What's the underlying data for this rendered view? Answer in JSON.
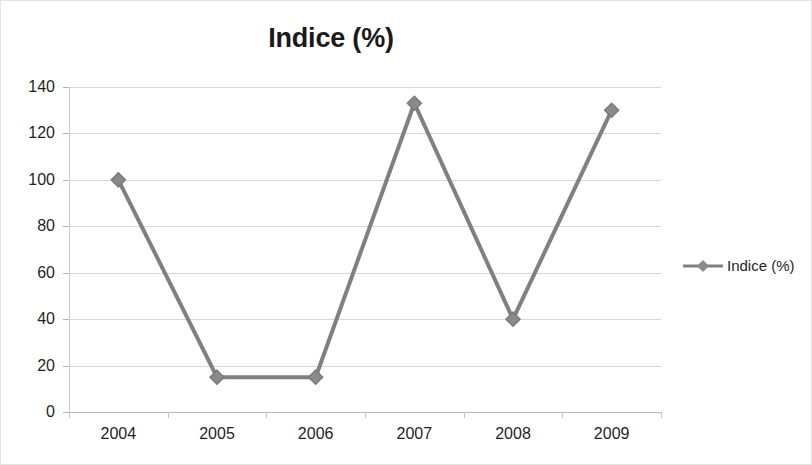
{
  "chart_data": {
    "type": "line",
    "title": "Indice (%)",
    "xlabel": "",
    "ylabel": "",
    "categories": [
      "2004",
      "2005",
      "2006",
      "2007",
      "2008",
      "2009"
    ],
    "series": [
      {
        "name": "Indice (%)",
        "values": [
          100,
          15,
          15,
          133,
          40,
          130
        ],
        "color": "#808080",
        "marker": "diamond"
      }
    ],
    "ylim": [
      0,
      140
    ],
    "ytick_step": 20,
    "yticks": [
      "140",
      "120",
      "100",
      "80",
      "60",
      "40",
      "20",
      "0"
    ],
    "ytick_values": [
      140,
      120,
      100,
      80,
      60,
      40,
      20,
      0
    ],
    "grid": "horizontal",
    "gridline_color": "#d6d6d6",
    "legend_position": "right",
    "legend_entries": [
      "Indice (%)"
    ],
    "background_color": "#ffffff",
    "border_color": "#e3e3e3"
  }
}
